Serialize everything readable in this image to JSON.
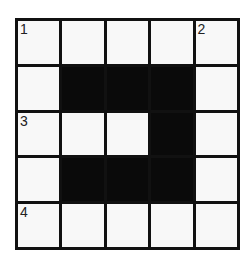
{
  "puzzle": {
    "type": "crossword",
    "rows": 5,
    "cols": 5,
    "grid": [
      [
        "W",
        "W",
        "W",
        "W",
        "W"
      ],
      [
        "W",
        "B",
        "B",
        "B",
        "W"
      ],
      [
        "W",
        "W",
        "W",
        "B",
        "W"
      ],
      [
        "W",
        "B",
        "B",
        "B",
        "W"
      ],
      [
        "W",
        "W",
        "W",
        "W",
        "W"
      ]
    ],
    "numbers": {
      "0-0": "1",
      "0-4": "2",
      "2-0": "3",
      "4-0": "4"
    },
    "colors": {
      "line": "#111111",
      "black_cell": "#0a0a0a",
      "white_cell": "#f8f8f8"
    }
  }
}
